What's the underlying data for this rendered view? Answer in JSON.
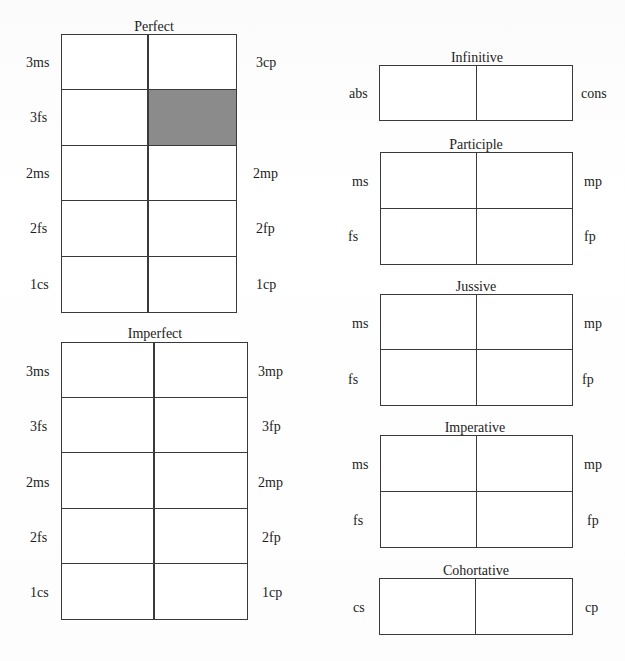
{
  "colors": {
    "line": "#3a3a3a",
    "shaded_cell": "#8b8b8b",
    "background": "#ffffff"
  },
  "paradigms": {
    "perfect": {
      "title": "Perfect",
      "rows": [
        {
          "left": "3ms",
          "right": "3cp"
        },
        {
          "left": "3fs",
          "right": ""
        },
        {
          "left": "2ms",
          "right": "2mp"
        },
        {
          "left": "2fs",
          "right": "2fp"
        },
        {
          "left": "1cs",
          "right": "1cp"
        }
      ],
      "shaded_cells": [
        {
          "row": 1,
          "col": 1
        }
      ]
    },
    "imperfect": {
      "title": "Imperfect",
      "rows": [
        {
          "left": "3ms",
          "right": "3mp"
        },
        {
          "left": "3fs",
          "right": "3fp"
        },
        {
          "left": "2ms",
          "right": "2mp"
        },
        {
          "left": "2fs",
          "right": "2fp"
        },
        {
          "left": "1cs",
          "right": "1cp"
        }
      ]
    },
    "infinitive": {
      "title": "Infinitive",
      "rows": [
        {
          "left": "abs",
          "right": "cons"
        }
      ]
    },
    "participle": {
      "title": "Participle",
      "rows": [
        {
          "left": "ms",
          "right": "mp"
        },
        {
          "left": "fs",
          "right": "fp"
        }
      ]
    },
    "jussive": {
      "title": "Jussive",
      "rows": [
        {
          "left": "ms",
          "right": "mp"
        },
        {
          "left": "fs",
          "right": "fp"
        }
      ]
    },
    "imperative": {
      "title": "Imperative",
      "rows": [
        {
          "left": "ms",
          "right": "mp"
        },
        {
          "left": "fs",
          "right": "fp"
        }
      ]
    },
    "cohortative": {
      "title": "Cohortative",
      "rows": [
        {
          "left": "cs",
          "right": "cp"
        }
      ]
    }
  }
}
